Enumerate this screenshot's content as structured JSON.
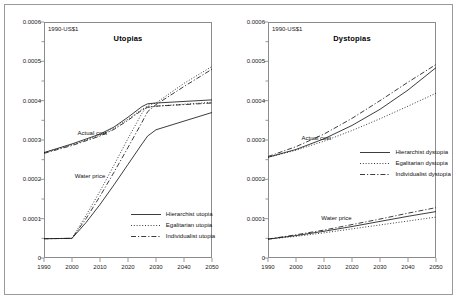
{
  "figure": {
    "unit_label": "1990-US$1"
  },
  "chart_data": [
    {
      "type": "line",
      "title": "Utopias",
      "xlabel": "",
      "ylabel": "1990-US$1",
      "xlim": [
        1990,
        2050
      ],
      "ylim": [
        0,
        0.0006
      ],
      "xticks": [
        1990,
        2000,
        2010,
        2020,
        2030,
        2040,
        2050
      ],
      "yticks": [
        0,
        0.0001,
        0.0002,
        0.0003,
        0.0004,
        0.0005,
        0.0006
      ],
      "ytick_labels": [
        "0",
        "0.0001",
        "0.0002",
        "0.0003",
        "0.0004",
        "0.0005",
        "0.0006"
      ],
      "xtick_labels": [
        "1990",
        "2000",
        "2010",
        "2020",
        "2030",
        "2040",
        "2050"
      ],
      "grid": false,
      "legend_position": "lower right",
      "annotations": [
        {
          "text": "Actual cost",
          "x": 2002,
          "y": 0.000315
        },
        {
          "text": "Water price",
          "x": 2001,
          "y": 0.000205
        }
      ],
      "series": [
        {
          "name": "Hierarchist utopia",
          "style": "solid",
          "group": "actual cost",
          "x": [
            1990,
            2000,
            2010,
            2015,
            2020,
            2025,
            2027,
            2030,
            2040,
            2050
          ],
          "values": [
            0.000268,
            0.00029,
            0.000315,
            0.000333,
            0.000358,
            0.000385,
            0.000392,
            0.000394,
            0.000398,
            0.000402
          ]
        },
        {
          "name": "Egalitarian utopia",
          "style": "dotted",
          "group": "actual cost",
          "x": [
            1990,
            2000,
            2010,
            2015,
            2020,
            2025,
            2027,
            2030,
            2040,
            2050
          ],
          "values": [
            0.000268,
            0.000288,
            0.000312,
            0.00033,
            0.000353,
            0.000378,
            0.000384,
            0.000386,
            0.000391,
            0.000396
          ]
        },
        {
          "name": "Individualist utopia",
          "style": "dashed",
          "group": "actual cost",
          "x": [
            1990,
            2000,
            2010,
            2015,
            2020,
            2025,
            2027,
            2030,
            2040,
            2050
          ],
          "values": [
            0.000266,
            0.000286,
            0.00031,
            0.000327,
            0.00035,
            0.000376,
            0.000383,
            0.000386,
            0.00039,
            0.000394
          ]
        },
        {
          "name": "Hierarchist utopia",
          "style": "solid",
          "group": "water price",
          "x": [
            1990,
            2000,
            2005,
            2010,
            2015,
            2020,
            2025,
            2027,
            2030,
            2040,
            2050
          ],
          "values": [
            4.9e-05,
            5e-05,
            9e-05,
            0.000136,
            0.000186,
            0.000238,
            0.00029,
            0.00031,
            0.000326,
            0.000348,
            0.00037
          ]
        },
        {
          "name": "Egalitarian utopia",
          "style": "dotted",
          "group": "water price",
          "x": [
            1990,
            2000,
            2005,
            2010,
            2015,
            2020,
            2025,
            2027,
            2030,
            2040,
            2050
          ],
          "values": [
            4.9e-05,
            5e-05,
            0.000108,
            0.00017,
            0.000236,
            0.000304,
            0.000368,
            0.000388,
            0.000394,
            0.000444,
            0.000487
          ]
        },
        {
          "name": "Individualist utopia",
          "style": "dashed",
          "group": "water price",
          "x": [
            1990,
            2000,
            2005,
            2010,
            2015,
            2020,
            2025,
            2027,
            2030,
            2040,
            2050
          ],
          "values": [
            4.9e-05,
            5e-05,
            0.0001,
            0.000157,
            0.000218,
            0.000281,
            0.000345,
            0.000372,
            0.00039,
            0.000436,
            0.00048
          ]
        }
      ],
      "legend_entries": [
        {
          "label": "Hierarchist utopia",
          "style": "solid"
        },
        {
          "label": "Egalitarian utopia",
          "style": "dotted"
        },
        {
          "label": "Individualist utopia",
          "style": "dashed"
        }
      ]
    },
    {
      "type": "line",
      "title": "Dystopias",
      "xlabel": "",
      "ylabel": "1990-US$1",
      "xlim": [
        1990,
        2050
      ],
      "ylim": [
        0,
        0.0006
      ],
      "xticks": [
        1990,
        2000,
        2010,
        2020,
        2030,
        2040,
        2050
      ],
      "yticks": [
        0,
        0.0001,
        0.0002,
        0.0003,
        0.0004,
        0.0005,
        0.0006
      ],
      "ytick_labels": [
        "0",
        "0.0001",
        "0.0002",
        "0.0003",
        "0.0004",
        "0.0005",
        "0.0006"
      ],
      "xtick_labels": [
        "1990",
        "2000",
        "2010",
        "2020",
        "2030",
        "2040",
        "2050"
      ],
      "grid": false,
      "legend_position": "center right",
      "annotations": [
        {
          "text": "Actual cost",
          "x": 2002,
          "y": 0.000303
        },
        {
          "text": "Water price",
          "x": 2009,
          "y": 9.8e-05
        }
      ],
      "series": [
        {
          "name": "Hierarchist dystopia",
          "style": "solid",
          "group": "actual cost",
          "x": [
            1990,
            2000,
            2010,
            2020,
            2030,
            2040,
            2050
          ],
          "values": [
            0.000256,
            0.000276,
            0.000303,
            0.000337,
            0.000378,
            0.000427,
            0.000484
          ]
        },
        {
          "name": "Egalitarian dystopia",
          "style": "dotted",
          "group": "actual cost",
          "x": [
            1990,
            2000,
            2010,
            2020,
            2030,
            2040,
            2050
          ],
          "values": [
            0.000256,
            0.000274,
            0.000297,
            0.000324,
            0.000354,
            0.000386,
            0.000419
          ]
        },
        {
          "name": "Individualist dystopia",
          "style": "dashed",
          "group": "actual cost",
          "x": [
            1990,
            2000,
            2010,
            2020,
            2030,
            2040,
            2050
          ],
          "values": [
            0.000258,
            0.000283,
            0.000315,
            0.000355,
            0.0004,
            0.000447,
            0.000492
          ]
        },
        {
          "name": "Hierarchist dystopia",
          "style": "solid",
          "group": "water price",
          "x": [
            1990,
            2000,
            2010,
            2020,
            2030,
            2040,
            2050
          ],
          "values": [
            4.8e-05,
            5.7e-05,
            6.8e-05,
            8e-05,
            9.3e-05,
            0.000106,
            0.000118
          ]
        },
        {
          "name": "Egalitarian dystopia",
          "style": "dotted",
          "group": "water price",
          "x": [
            1990,
            2000,
            2010,
            2020,
            2030,
            2040,
            2050
          ],
          "values": [
            4.8e-05,
            5.5e-05,
            6.4e-05,
            7.4e-05,
            8.4e-05,
            9.4e-05,
            0.000104
          ]
        },
        {
          "name": "Individualist dystopia",
          "style": "dashed",
          "group": "water price",
          "x": [
            1990,
            2000,
            2010,
            2020,
            2030,
            2040,
            2050
          ],
          "values": [
            4.8e-05,
            5.9e-05,
            7.1e-05,
            8.5e-05,
            9.9e-05,
            0.000114,
            0.000128
          ]
        }
      ],
      "legend_entries": [
        {
          "label": "Hierarchist dystopia",
          "style": "solid"
        },
        {
          "label": "Egalitarian dystopia",
          "style": "dotted"
        },
        {
          "label": "Individualist dystopia",
          "style": "dashed"
        }
      ]
    }
  ]
}
